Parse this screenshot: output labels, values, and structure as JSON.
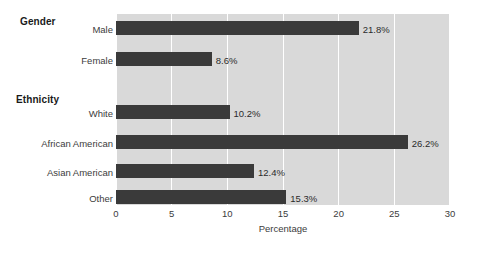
{
  "chart_data": {
    "type": "bar",
    "orientation": "horizontal",
    "title": "",
    "xlabel": "Percentage",
    "ylabel": "",
    "xlim": [
      0,
      30
    ],
    "xticks": [
      0,
      5,
      10,
      15,
      20,
      25,
      30
    ],
    "xtick_labels": [
      "0",
      "5",
      "10",
      "15",
      "20",
      "25",
      "30"
    ],
    "grid": true,
    "legend": false,
    "categories": [
      "Male",
      "Female",
      "White",
      "African American",
      "Asian American",
      "Other"
    ],
    "values": [
      21.8,
      8.6,
      10.2,
      26.2,
      12.4,
      15.3
    ],
    "data_labels": [
      "21.8%",
      "8.6%",
      "10.2%",
      "26.2%",
      "12.4%",
      "15.3%"
    ],
    "groups": [
      {
        "name": "Gender",
        "categories": [
          "Male",
          "Female"
        ]
      },
      {
        "name": "Ethnicity",
        "categories": [
          "White",
          "African American",
          "Asian American",
          "Other"
        ]
      }
    ],
    "colors": {
      "bar": "#3a3a3a",
      "plot_background": "#d9d9d9",
      "gridline": "#ffffff",
      "text": "#3c3c3c",
      "header_text": "#1a1a1a",
      "page_background": "#ffffff"
    }
  },
  "group_headers": [
    {
      "label": "Gender"
    },
    {
      "label": "Ethnicity"
    }
  ],
  "bars": [
    {
      "label": "Male",
      "value": 21.8,
      "data_label": "21.8%"
    },
    {
      "label": "Female",
      "value": 8.6,
      "data_label": "8.6%"
    },
    {
      "label": "White",
      "value": 10.2,
      "data_label": "10.2%"
    },
    {
      "label": "African American",
      "value": 26.2,
      "data_label": "26.2%"
    },
    {
      "label": "Asian American",
      "value": 12.4,
      "data_label": "12.4%"
    },
    {
      "label": "Other",
      "value": 15.3,
      "data_label": "15.3%"
    }
  ],
  "axis": {
    "title": "Percentage",
    "ticks": [
      "0",
      "5",
      "10",
      "15",
      "20",
      "25",
      "30"
    ]
  }
}
